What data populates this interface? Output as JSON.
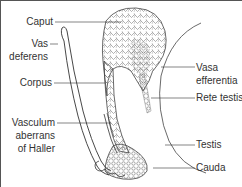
{
  "figure": {
    "labels_left": [
      {
        "id": "caput",
        "text": "Caput"
      },
      {
        "id": "vas-deferens",
        "line1": "Vas",
        "line2": "deferens"
      },
      {
        "id": "corpus",
        "text": "Corpus"
      },
      {
        "id": "vasculum-aberrans",
        "line1": "Vasculum",
        "line2": "aberrans",
        "line3": "of Haller"
      }
    ],
    "labels_right": [
      {
        "id": "vasa-efferentia",
        "line1": "Vasa",
        "line2": "efferentia"
      },
      {
        "id": "rete-testis",
        "text": "Rete testis"
      },
      {
        "id": "testis",
        "text": "Testis"
      },
      {
        "id": "cauda",
        "text": "Cauda"
      }
    ],
    "colors": {
      "line": "#333333",
      "text": "#333333",
      "border": "#555555",
      "background": "#ffffff"
    }
  }
}
